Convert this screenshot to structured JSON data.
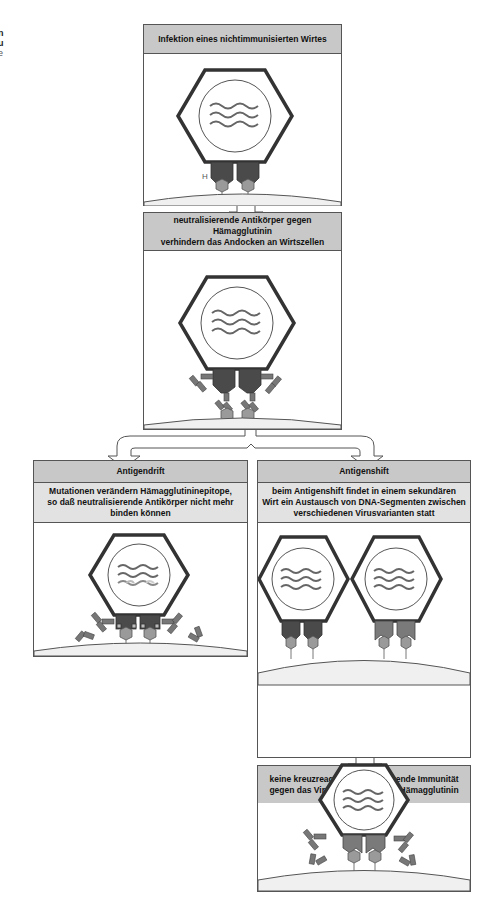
{
  "edge_text": {
    "line1": "n",
    "line2": "u",
    "line3": "e"
  },
  "panels": {
    "infection": {
      "title": "Infektion eines nichtimmunisierten Wirtes",
      "label_h": "H"
    },
    "neutralizing": {
      "title_line1": "neutralisierende Antikörper gegen Hämagglutinin",
      "title_line2": "verhindern das Andocken an Wirtszellen"
    },
    "drift": {
      "title": "Antigendrift",
      "desc_line1": "Mutationen verändern Hämagglutininepitope,",
      "desc_line2": "so daß neutralisierende Antikörper nicht mehr",
      "desc_line3": "binden können"
    },
    "shift": {
      "title": "Antigenshift",
      "desc_line1": "beim Antigenshift findet in einem sekundären",
      "desc_line2": "Wirt ein Austausch von DNA-Segmenten zwischen",
      "desc_line3": "verschiedenen Virusvarianten statt"
    },
    "no_immunity": {
      "title_line1": "keine kreuzreagierende, schützende Immunität",
      "title_line2": "gegen das Virus mit dem neuen Hämagglutinin"
    }
  },
  "colors": {
    "header_gray": "#c8c8c8",
    "subheader_gray": "#e2e2e2",
    "hemagglutinin_dark": "#4a4a4a",
    "hemagglutinin_new": "#7a7a7a",
    "receptor": "#9a9a9a",
    "cell_fill": "#f0f0f0"
  }
}
